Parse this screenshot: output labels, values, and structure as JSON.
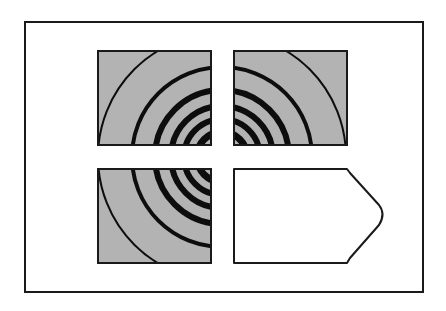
{
  "figure": {
    "colors": {
      "background": "#ffffff",
      "frame": "#1a1a1a",
      "tile_fill": "#b3b3b3",
      "ring": "#0d0d0d",
      "blank_tile_fill": "#ffffff"
    },
    "tiles": [
      {
        "position": "top-left",
        "type": "rings"
      },
      {
        "position": "top-right",
        "type": "rings"
      },
      {
        "position": "bottom-left",
        "type": "rings"
      },
      {
        "position": "bottom-right",
        "type": "blank-arrow-shape"
      }
    ],
    "rings": {
      "center": [
        222,
        157
      ],
      "radii": [
        124,
        90,
        67,
        51,
        38,
        25,
        14
      ],
      "stroke_widths": [
        2,
        4,
        6,
        6,
        6,
        6,
        7
      ]
    }
  }
}
